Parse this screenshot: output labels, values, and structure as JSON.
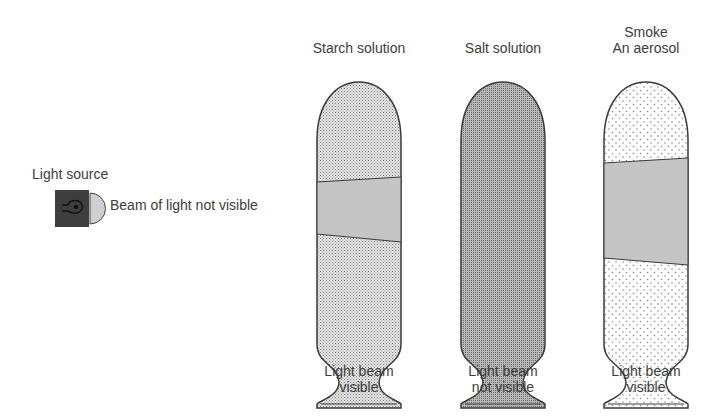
{
  "diagram": {
    "light_source": {
      "label": "Light source",
      "beam_note": "Beam of light not visible",
      "icon": "light-bulb-icon"
    },
    "tubes": [
      {
        "id": "starch",
        "title": "Starch solution",
        "title_line2": "",
        "caption_line1": "Light beam",
        "caption_line2": "visible",
        "fill": "fine-dots",
        "beam_visible": true
      },
      {
        "id": "salt",
        "title": "Salt solution",
        "title_line2": "",
        "caption_line1": "Light beam",
        "caption_line2": "not visible",
        "fill": "dense-dots",
        "beam_visible": false
      },
      {
        "id": "smoke",
        "title": "Smoke",
        "title_line2": "An aerosol",
        "caption_line1": "Light beam",
        "caption_line2": "visible",
        "fill": "sparse-dots",
        "beam_visible": true
      }
    ],
    "colors": {
      "outline": "#3a3a3a",
      "beam": "#c4c4c4",
      "lamp_body": "#3e3e3e",
      "lens": "#cfcfcf"
    }
  }
}
